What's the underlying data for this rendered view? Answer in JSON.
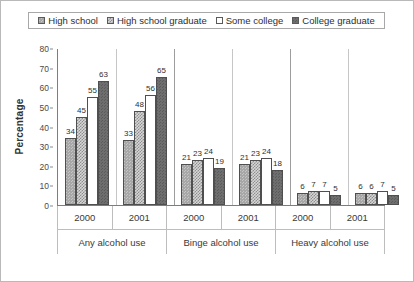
{
  "legend": {
    "items": [
      {
        "label": "High school",
        "swatch": "swatch-high-school"
      },
      {
        "label": "High school graduate",
        "swatch": "swatch-high-school-graduate"
      },
      {
        "label": "Some college",
        "swatch": "swatch-some-college"
      },
      {
        "label": "College graduate",
        "swatch": "swatch-college-graduate"
      }
    ]
  },
  "axis": {
    "y_title": "Percentage",
    "y_ticks": [
      "80",
      "70",
      "60",
      "50",
      "40",
      "30",
      "20",
      "10",
      "0"
    ]
  },
  "groups": [
    {
      "category": "Any alcohol use",
      "year": "2000"
    },
    {
      "category": "Any alcohol use",
      "year": "2001"
    },
    {
      "category": "Binge alcohol use",
      "year": "2000"
    },
    {
      "category": "Binge alcohol use",
      "year": "2001"
    },
    {
      "category": "Heavy alcohol use",
      "year": "2000"
    },
    {
      "category": "Heavy alcohol use",
      "year": "2001"
    }
  ],
  "x_categories": [
    {
      "name": "Any alcohol use",
      "years": [
        "2000",
        "2001"
      ]
    },
    {
      "name": "Binge alcohol use",
      "years": [
        "2000",
        "2001"
      ]
    },
    {
      "name": "Heavy alcohol use",
      "years": [
        "2000",
        "2001"
      ]
    }
  ],
  "colors": {
    "high_school": "#a7a7a7",
    "high_school_graduate": "#d6d6d6",
    "some_college": "#ffffff",
    "college_graduate": "#6e6e6e",
    "axis": "#7d7d7d",
    "frame": "#b9b9b9"
  },
  "chart_data": {
    "type": "bar",
    "title": "",
    "xlabel": "",
    "ylabel": "Percentage",
    "ylim": [
      0,
      80
    ],
    "ytick_step": 10,
    "grid": false,
    "legend_position": "top",
    "categories": [
      "Any alcohol use 2000",
      "Any alcohol use 2001",
      "Binge alcohol use 2000",
      "Binge alcohol use 2001",
      "Heavy alcohol use 2000",
      "Heavy alcohol use 2001"
    ],
    "series": [
      {
        "name": "High school",
        "values": [
          34,
          33,
          21,
          21,
          6,
          6
        ]
      },
      {
        "name": "High school graduate",
        "values": [
          45,
          48,
          23,
          23,
          7,
          6
        ]
      },
      {
        "name": "Some college",
        "values": [
          55,
          56,
          24,
          24,
          7,
          7
        ]
      },
      {
        "name": "College graduate",
        "values": [
          63,
          65,
          19,
          18,
          5,
          5
        ]
      }
    ]
  }
}
